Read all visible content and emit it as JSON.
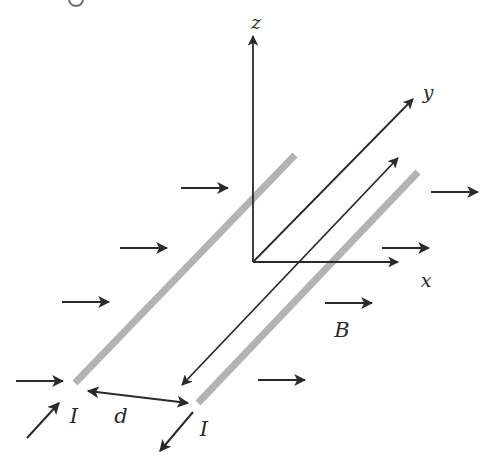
{
  "labels": {
    "z_axis": "z",
    "y_axis": "y",
    "x_axis": "x",
    "field": "B",
    "separation": "d",
    "current_left": "I",
    "current_right": "I"
  },
  "colors": {
    "ink": "#2a2a2a",
    "wire": "#b3b3b3",
    "background": "#ffffff"
  },
  "diagram": {
    "field_arrow_count": 8,
    "wires": [
      {
        "name": "left-wire",
        "current_direction": "toward +y"
      },
      {
        "name": "right-wire",
        "current_direction": "toward -y"
      }
    ]
  }
}
